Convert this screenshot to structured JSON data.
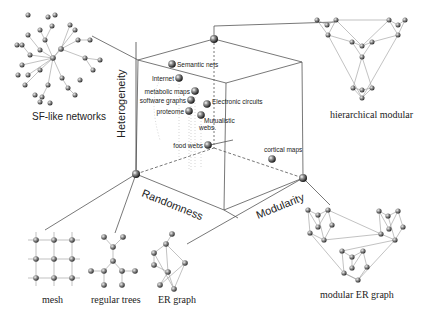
{
  "axes": {
    "heterogeneity": "Heterogeneity",
    "randomness": "Randomness",
    "modularity": "Modularity"
  },
  "points": [
    {
      "label": "Semantic nets",
      "x": 172,
      "y": 64
    },
    {
      "label": "Internet",
      "x": 179,
      "y": 78
    },
    {
      "label": "metabolic maps",
      "x": 195,
      "y": 91
    },
    {
      "label": "software graphs",
      "x": 191,
      "y": 100
    },
    {
      "label": "Electronic circuits",
      "x": 207,
      "y": 104
    },
    {
      "label": "proteome",
      "x": 189,
      "y": 111
    },
    {
      "label": "Mutualistic webs",
      "x": 201,
      "y": 115
    },
    {
      "label": "food webs",
      "x": 208,
      "y": 145
    },
    {
      "label": "cortical maps",
      "x": 272,
      "y": 159
    }
  ],
  "insets": {
    "sf_like": "SF-like networks",
    "hierarchical": "hierarchical modular",
    "mesh": "mesh",
    "trees": "regular trees",
    "er": "ER graph",
    "modular_er": "modular ER graph"
  }
}
